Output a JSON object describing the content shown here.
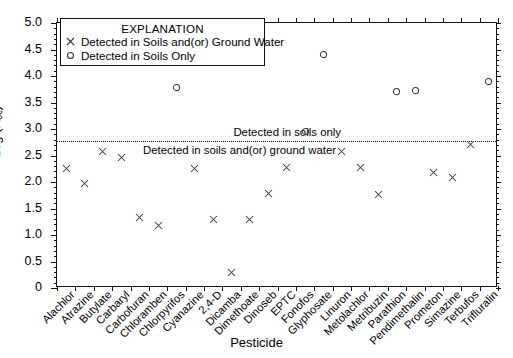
{
  "chart_data": {
    "type": "scatter",
    "title": "",
    "xlabel": "Pesticide",
    "ylabel": "Log (Koc)",
    "ylabel_main": "Log (K",
    "ylabel_sub": "oc",
    "ylabel_tail": ")",
    "ylim": [
      0,
      5.0
    ],
    "yticks": [
      "0",
      "0.5",
      "1.0",
      "1.5",
      "2.0",
      "2.5",
      "3.0",
      "3.5",
      "4.0",
      "4.5",
      "5.0"
    ],
    "ytick_values": [
      0,
      0.5,
      1.0,
      1.5,
      2.0,
      2.5,
      3.0,
      3.5,
      4.0,
      4.5,
      5.0
    ],
    "grid": false,
    "legend_position": "top-left-inside",
    "threshold": {
      "value": 2.77,
      "style": "dotted",
      "label_above": "Detected in soils only",
      "label_below": "Detected in soils and(or) ground water"
    },
    "categories": [
      "Alachlor",
      "Atrazine",
      "Butylate",
      "Carbaryl",
      "Carbofuran",
      "Chloramben",
      "Chlorpyrifos",
      "Cyanazine",
      "2,4-D",
      "Dicamba",
      "Dimethoate",
      "Dinoseb",
      "EPTC",
      "Fonofos",
      "Glyphosate",
      "Linuron",
      "Metolachlor",
      "Metribuzin",
      "Parathion",
      "Pendimethalin",
      "Prometon",
      "Simazine",
      "Terbufos",
      "Trifluralin"
    ],
    "series": [
      {
        "name": "Detected in Soils and(or) Ground Water",
        "marker": "x",
        "points": [
          {
            "category": "Alachlor",
            "value": 2.25
          },
          {
            "category": "Atrazine",
            "value": 1.97
          },
          {
            "category": "Butylate",
            "value": 2.58
          },
          {
            "category": "Carbaryl",
            "value": 2.47
          },
          {
            "category": "Carbofuran",
            "value": 1.33
          },
          {
            "category": "Chloramben",
            "value": 1.17
          },
          {
            "category": "Cyanazine",
            "value": 2.25
          },
          {
            "category": "2,4-D",
            "value": 1.3
          },
          {
            "category": "Dicamba",
            "value": 0.3
          },
          {
            "category": "Dimethoate",
            "value": 1.3
          },
          {
            "category": "Dinoseb",
            "value": 1.79
          },
          {
            "category": "EPTC",
            "value": 2.27
          },
          {
            "category": "Linuron",
            "value": 2.58
          },
          {
            "category": "Metolachlor",
            "value": 2.28
          },
          {
            "category": "Metribuzin",
            "value": 1.77
          },
          {
            "category": "Prometon",
            "value": 2.17
          },
          {
            "category": "Simazine",
            "value": 2.08
          },
          {
            "category": "Terbufos",
            "value": 2.7
          }
        ]
      },
      {
        "name": "Detected in Soils Only",
        "marker": "o",
        "points": [
          {
            "category": "Chlorpyrifos",
            "value": 3.79
          },
          {
            "category": "Fonofos",
            "value": 2.95
          },
          {
            "category": "Glyphosate",
            "value": 4.41
          },
          {
            "category": "Parathion",
            "value": 3.71
          },
          {
            "category": "Pendimethalin",
            "value": 3.72
          },
          {
            "category": "Trifluralin",
            "value": 3.9
          }
        ]
      }
    ]
  },
  "legend": {
    "title": "EXPLANATION",
    "entries": [
      {
        "marker": "x",
        "label": "Detected in Soils and(or) Ground Water"
      },
      {
        "marker": "o",
        "label": "Detected in Soils Only"
      }
    ]
  },
  "colors": {
    "axis": "#111111",
    "marker": "#333333",
    "background": "#ffffff"
  }
}
